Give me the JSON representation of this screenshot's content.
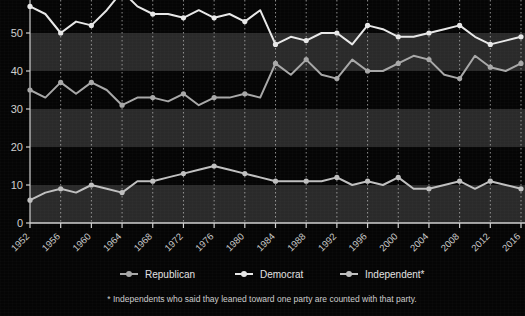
{
  "chart_data": {
    "type": "line",
    "title": "",
    "subtitle": "",
    "xlabel": "",
    "ylabel": "",
    "xlim": [
      1952,
      2016
    ],
    "ylim": [
      0,
      57
    ],
    "grid": true,
    "legend_position": "bottom",
    "x": [
      1952,
      1954,
      1956,
      1958,
      1960,
      1962,
      1964,
      1966,
      1968,
      1970,
      1972,
      1974,
      1976,
      1978,
      1980,
      1982,
      1984,
      1986,
      1988,
      1990,
      1992,
      1994,
      1996,
      1998,
      2000,
      2002,
      2004,
      2006,
      2008,
      2010,
      2012,
      2014,
      2016
    ],
    "xticks": [
      1952,
      1956,
      1960,
      1964,
      1968,
      1972,
      1976,
      1980,
      1984,
      1988,
      1992,
      1996,
      2000,
      2004,
      2008,
      2012,
      2016
    ],
    "xtick_labels": [
      "1952",
      "1956",
      "1960",
      "1964",
      "1968",
      "1972",
      "1976",
      "1980",
      "1984",
      "1988",
      "1992",
      "1996",
      "2000",
      "2004",
      "2008",
      "2012",
      "2016"
    ],
    "yticks": [
      0,
      10,
      20,
      30,
      40,
      50
    ],
    "ytick_labels": [
      "0",
      "10",
      "20",
      "30",
      "40",
      "50"
    ],
    "series": [
      {
        "name": "Democrat",
        "color": "#e8e8e8",
        "values": [
          57,
          55,
          50,
          53,
          52,
          56,
          61,
          57,
          55,
          55,
          54,
          56,
          54,
          55,
          53,
          56,
          47,
          49,
          48,
          50,
          50,
          47,
          52,
          51,
          49,
          49,
          50,
          51,
          52,
          49,
          47,
          48,
          49
        ]
      },
      {
        "name": "Republican",
        "color": "#a8a8a8",
        "values": [
          35,
          33,
          37,
          34,
          37,
          35,
          31,
          33,
          33,
          32,
          34,
          31,
          33,
          33,
          34,
          33,
          42,
          39,
          43,
          39,
          38,
          43,
          40,
          40,
          42,
          44,
          43,
          39,
          38,
          44,
          41,
          40,
          42
        ]
      },
      {
        "name": "Independent*",
        "color": "#c0c0c0",
        "values": [
          6,
          8,
          9,
          8,
          10,
          9,
          8,
          11,
          11,
          12,
          13,
          14,
          15,
          14,
          13,
          12,
          11,
          11,
          11,
          11,
          12,
          10,
          11,
          10,
          12,
          9,
          9,
          10,
          11,
          9,
          11,
          10,
          9
        ]
      }
    ]
  },
  "legend": {
    "items": [
      {
        "label": "Republican",
        "color": "#a8a8a8"
      },
      {
        "label": "Democrat",
        "color": "#e8e8e8"
      },
      {
        "label": "Independent*",
        "color": "#c0c0c0"
      }
    ]
  },
  "footnote": {
    "text": "* Independents who said thay leaned toward one party are counted with that party."
  },
  "colors": {
    "background": "#050505",
    "band_light": "#2a2a2a",
    "band_dark": "#0a0a0a",
    "axis": "#d0d0d0",
    "gridline": "#b9b9b9"
  }
}
